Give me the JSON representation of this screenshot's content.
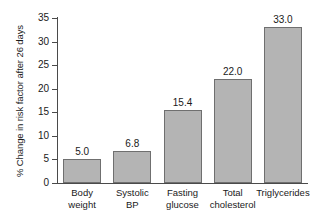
{
  "chart_data": {
    "type": "bar",
    "title": "",
    "subtitle": "",
    "xlabel": "",
    "ylabel": "% Change in risk factor after 26 days",
    "categories": [
      "Body\nweight",
      "Systolic\nBP",
      "Fasting\nglucose",
      "Total\ncholesterol",
      "Triglycerides"
    ],
    "values": [
      5.0,
      6.8,
      15.4,
      22.0,
      33.0
    ],
    "value_labels": [
      "5.0",
      "6.8",
      "15.4",
      "22.0",
      "33.0"
    ],
    "ylim": [
      0,
      35
    ],
    "ytick_values": [
      0,
      5,
      10,
      15,
      20,
      25,
      30,
      35
    ],
    "ytick_labels": [
      "0",
      "5",
      "10",
      "15",
      "20",
      "25",
      "30",
      "35"
    ],
    "grid": false,
    "legend": null,
    "bar_color": "#b4b4b4",
    "bar_edge_color": "#6f6f6f",
    "axis_color": "#4a4a4a",
    "background": "#ffffff"
  }
}
